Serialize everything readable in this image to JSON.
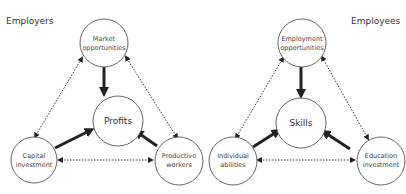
{
  "left": {
    "title": "Employers",
    "top": [
      "Market",
      "opportunities"
    ],
    "center": "Profits",
    "bottom_left": [
      "Capital",
      "investment"
    ],
    "bottom_right": [
      "Productive",
      "workers"
    ]
  },
  "right": {
    "title": "Employees",
    "top": [
      "Employment",
      "opportunities"
    ],
    "center": "Skills",
    "bottom_left": [
      "Individual",
      "abilities"
    ],
    "bottom_right": [
      "Education",
      "investment"
    ]
  },
  "colors": {
    "stroke": "#222222",
    "node_border": "#555555",
    "text": "#333333"
  }
}
